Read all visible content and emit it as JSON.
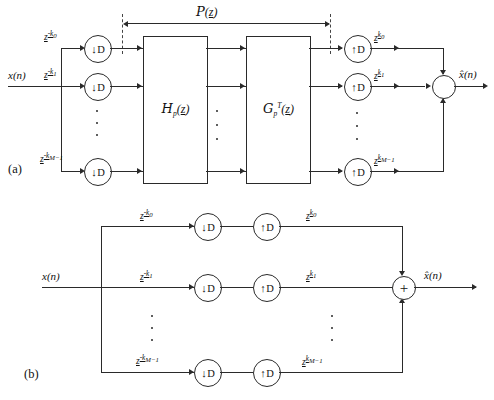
{
  "figure": {
    "caption_a": "(a)",
    "caption_b": "(b)"
  },
  "signals": {
    "input": "x(n)",
    "input_arg": "n",
    "output": "x̂(n)",
    "output_hat": "x̂",
    "output_arg": "n"
  },
  "panel_a": {
    "span_label": "P(z)",
    "span_label_name": "P",
    "span_label_arg": "z",
    "blocks": [
      {
        "name": "H",
        "sub": "p",
        "sup": "",
        "arg": "z"
      },
      {
        "name": "G",
        "sub": "p",
        "sup": "T",
        "arg": "z"
      }
    ],
    "branches": [
      {
        "delay_base": "z",
        "delay_exp": "-k",
        "delay_idx": "0",
        "advance_base": "z",
        "advance_exp": "k",
        "advance_idx": "0",
        "down": "D",
        "up": "D"
      },
      {
        "delay_base": "z",
        "delay_exp": "-k",
        "delay_idx": "1",
        "advance_base": "z",
        "advance_exp": "k",
        "advance_idx": "1",
        "down": "D",
        "up": "D"
      },
      {
        "delay_base": "z",
        "delay_exp": "-k",
        "delay_idx": "M−1",
        "advance_base": "z",
        "advance_exp": "k",
        "advance_idx": "M−1",
        "down": "D",
        "up": "D"
      }
    ],
    "downsampler_glyph": "↓",
    "upsampler_glyph": "↑",
    "sampler_letter": "D",
    "summing_symbol": "",
    "ellipsis": "⋮"
  },
  "panel_b": {
    "branches": [
      {
        "delay_base": "z",
        "delay_exp": "-k",
        "delay_idx": "0",
        "advance_base": "z",
        "advance_exp": "k",
        "advance_idx": "0",
        "down": "D",
        "up": "D"
      },
      {
        "delay_base": "z",
        "delay_exp": "-k",
        "delay_idx": "1",
        "advance_base": "z",
        "advance_exp": "k",
        "advance_idx": "1",
        "down": "D",
        "up": "D"
      },
      {
        "delay_base": "z",
        "delay_exp": "-k",
        "delay_idx": "M−1",
        "advance_base": "z",
        "advance_exp": "k",
        "advance_idx": "M−1",
        "down": "D",
        "up": "D"
      }
    ],
    "downsampler_glyph": "↓",
    "upsampler_glyph": "↑",
    "sampler_letter": "D",
    "summing_symbol": "+",
    "ellipsis": "⋮"
  },
  "colors": {
    "line": "#2a2a2a",
    "background": "#ffffff",
    "dashed": "#444444"
  }
}
